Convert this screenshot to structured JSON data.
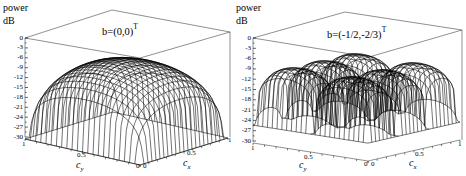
{
  "chart_data": [
    {
      "type": "surface3d",
      "title": "b=(0,0)",
      "title_superscript": "T",
      "zlabel_line1": "power",
      "zlabel_line2": "dB",
      "xlabel": "c",
      "xlabel_sub": "x",
      "ylabel": "c",
      "ylabel_sub": "y",
      "zlim": [
        -30,
        0
      ],
      "z_ticks": [
        "0",
        "-3",
        "-6",
        "-9",
        "-12",
        "-15",
        "-18",
        "-21",
        "-24",
        "-27",
        "-30"
      ],
      "x_ticks": [
        "0",
        "0.5",
        "1"
      ],
      "y_ticks": [
        "1",
        "0.5",
        "0"
      ],
      "xlim": [
        0,
        1
      ],
      "ylim": [
        0,
        1
      ],
      "description": "Single dome-shaped mesh surface peaking near -7 dB in the interior, dropping sharply to about -30 dB at the edges and corners (c_x=0 or c_y=0, c_x=1 or c_y=1)",
      "peak_db": -7,
      "edge_db": -30,
      "grid": false
    },
    {
      "type": "surface3d",
      "title": "b=(-1/2,-2/3)",
      "title_superscript": "T",
      "zlabel_line1": "power",
      "zlabel_line2": "dB",
      "xlabel": "c",
      "xlabel_sub": "x",
      "ylabel": "c",
      "ylabel_sub": "y",
      "zlim": [
        -30,
        0
      ],
      "z_ticks": [
        "0",
        "-3",
        "-6",
        "-9",
        "-12",
        "-15",
        "-18",
        "-21",
        "-24",
        "-27",
        "-30"
      ],
      "x_ticks": [
        "0",
        "0.5",
        "1"
      ],
      "y_ticks": [
        "1",
        "0.5",
        "0"
      ],
      "xlim": [
        0,
        1
      ],
      "ylim": [
        0,
        1
      ],
      "description": "Mesh surface with multiple lobes (approx 3x2 array of domes) peaking near -6 to -10 dB, separated by deep nulls reaching about -20 to -30 dB",
      "peak_db": -7,
      "edge_db": -30,
      "grid": false
    }
  ]
}
